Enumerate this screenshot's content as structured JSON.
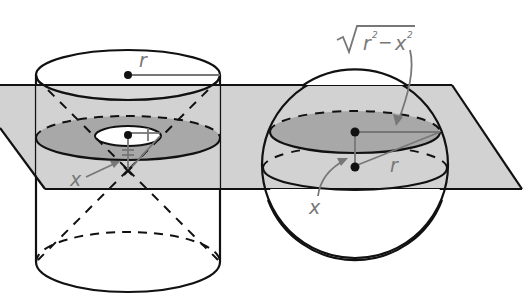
{
  "figure": {
    "colors": {
      "background": "#ffffff",
      "plane": "#d2d2d2",
      "cross_section": "#a8a8a8",
      "stroke": "#111111",
      "label": "#777777"
    }
  },
  "labels": {
    "cylinder_radius": "r",
    "cylinder_height": "x",
    "sphere_radius": "r",
    "sphere_height": "x",
    "sqrt_expression": "r",
    "sqrt_exp_r": "2",
    "sqrt_minus": "−",
    "sqrt_x": "x",
    "sqrt_exp_x": "2"
  }
}
